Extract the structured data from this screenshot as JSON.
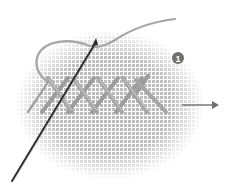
{
  "illustration": {
    "subject": "cross-stitch technique",
    "step_badge": "1",
    "stitch_count": 5,
    "direction": "right",
    "colors": {
      "fabric_grid": "#bfbfbf",
      "thread": "#9a9a9a",
      "thread_highlight": "#c8c8c8",
      "needle": "#333333",
      "badge": "#707070",
      "arrow": "#6e6e6e"
    }
  }
}
